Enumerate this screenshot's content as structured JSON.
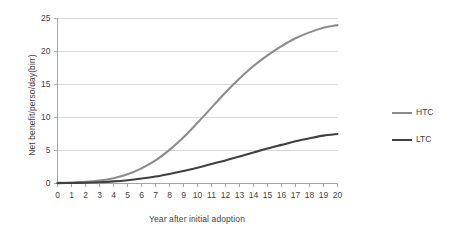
{
  "chart_data": {
    "type": "line",
    "title": "",
    "xlabel": "Year after initial adoption",
    "ylabel": "Net benefit/perso/day(birr)",
    "xlim": [
      0,
      20
    ],
    "ylim": [
      0,
      25
    ],
    "yticks": [
      0,
      5,
      10,
      15,
      20,
      25
    ],
    "xticks": [
      0,
      1,
      2,
      3,
      4,
      5,
      6,
      7,
      8,
      9,
      10,
      11,
      12,
      13,
      14,
      15,
      16,
      17,
      18,
      19,
      20
    ],
    "grid": "horizontal",
    "legend_position": "right",
    "x": [
      0,
      1,
      2,
      3,
      4,
      5,
      6,
      7,
      8,
      9,
      10,
      11,
      12,
      13,
      14,
      15,
      16,
      17,
      18,
      19,
      20
    ],
    "series": [
      {
        "name": "HTC",
        "color": "#8c8c8c",
        "values": [
          0.1,
          0.15,
          0.25,
          0.45,
          0.8,
          1.4,
          2.3,
          3.5,
          5.1,
          7.0,
          9.2,
          11.5,
          13.8,
          15.9,
          17.8,
          19.4,
          20.8,
          22.0,
          22.9,
          23.6,
          24.0
        ]
      },
      {
        "name": "LTC",
        "color": "#404040",
        "values": [
          0.05,
          0.08,
          0.12,
          0.2,
          0.32,
          0.5,
          0.75,
          1.05,
          1.45,
          1.9,
          2.4,
          2.95,
          3.5,
          4.1,
          4.7,
          5.3,
          5.85,
          6.4,
          6.85,
          7.25,
          7.5
        ]
      }
    ]
  },
  "legend": {
    "items": [
      {
        "label": "HTC",
        "color": "#8c8c8c"
      },
      {
        "label": "LTC",
        "color": "#404040"
      }
    ]
  },
  "axes": {
    "y_title": "Net benefit/perso/day(birr)",
    "x_title": "Year after initial adoption"
  },
  "style": {
    "gridline_color": "#d9d9d9",
    "axis_color": "#a6a6a6",
    "text_color": "#3f3f3f"
  }
}
